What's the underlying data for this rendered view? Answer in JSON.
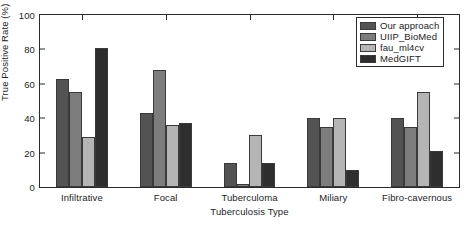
{
  "chart_data": {
    "type": "bar",
    "title": "",
    "subtitle": "",
    "xlabel": "Tuberculosis Type",
    "ylabel": "True Positive Rate (%)",
    "categories": [
      "Infiltrative",
      "Focal",
      "Tuberculoma",
      "Miliary",
      "Fibro-cavernous"
    ],
    "series": [
      {
        "name": "Our approach",
        "color": "#535353",
        "values": [
          63,
          43,
          14,
          40,
          40
        ]
      },
      {
        "name": "UIIP_BioMed",
        "color": "#7d7d7d",
        "values": [
          55,
          68,
          2,
          35,
          35
        ]
      },
      {
        "name": "fau_ml4cv",
        "color": "#b5b5b5",
        "values": [
          29,
          36,
          30,
          40,
          55
        ]
      },
      {
        "name": "MedGIFT",
        "color": "#2e2e2e",
        "values": [
          81,
          37,
          14,
          10,
          21
        ]
      }
    ],
    "ylim": [
      0,
      100
    ],
    "yticks": [
      0,
      20,
      40,
      60,
      80,
      100
    ],
    "ytick_labels": [
      "0",
      "20",
      "40",
      "60",
      "80",
      "100"
    ],
    "grid": false,
    "legend_position": "top-right",
    "bar_edge_color": "#3a3a3a",
    "axis_color": "#2b2b2b",
    "background": "#ffffff"
  }
}
